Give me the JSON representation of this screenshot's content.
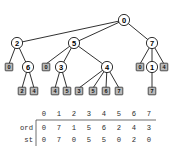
{
  "figure": {
    "kind": "tree-diagram-with-table",
    "tree": {
      "root": {
        "id": "n0",
        "label": "0",
        "type": "internal",
        "x": 124,
        "y": 20
      },
      "internal_nodes": [
        {
          "id": "n0",
          "label": "0",
          "x": 124,
          "y": 20
        },
        {
          "id": "n2",
          "label": "2",
          "x": 17,
          "y": 43
        },
        {
          "id": "n5",
          "label": "5",
          "x": 74,
          "y": 43
        },
        {
          "id": "n7",
          "label": "7",
          "x": 152,
          "y": 43
        },
        {
          "id": "n6",
          "label": "6",
          "x": 28,
          "y": 67
        },
        {
          "id": "n3",
          "label": "3",
          "x": 61,
          "y": 67
        },
        {
          "id": "n4",
          "label": "4",
          "x": 107,
          "y": 67
        },
        {
          "id": "n1",
          "label": "1",
          "x": 152,
          "y": 67
        }
      ],
      "leaves": [
        {
          "id": "l_a",
          "label": "0",
          "x": 9,
          "y": 67,
          "parent": "n2"
        },
        {
          "id": "l_b",
          "label": "2",
          "x": 22,
          "y": 91,
          "parent": "n6"
        },
        {
          "id": "l_c",
          "label": "4",
          "x": 34,
          "y": 91,
          "parent": "n6"
        },
        {
          "id": "l_d",
          "label": "0",
          "x": 46,
          "y": 67,
          "parent": "n5"
        },
        {
          "id": "l_e",
          "label": "4",
          "x": 55,
          "y": 91,
          "parent": "n3"
        },
        {
          "id": "l_f",
          "label": "5",
          "x": 67,
          "y": 91,
          "parent": "n3"
        },
        {
          "id": "l_g",
          "label": "3",
          "x": 79,
          "y": 91,
          "parent": "n4"
        },
        {
          "id": "l_h",
          "label": "5",
          "x": 93,
          "y": 91,
          "parent": "n4"
        },
        {
          "id": "l_i",
          "label": "6",
          "x": 106,
          "y": 91,
          "parent": "n4"
        },
        {
          "id": "l_j",
          "label": "7",
          "x": 119,
          "y": 91,
          "parent": "n4"
        },
        {
          "id": "l_k",
          "label": "0",
          "x": 140,
          "y": 67,
          "parent": "n7"
        },
        {
          "id": "l_l",
          "label": "4",
          "x": 164,
          "y": 67,
          "parent": "n7"
        },
        {
          "id": "l_m",
          "label": "7",
          "x": 152,
          "y": 91,
          "parent": "n1"
        }
      ],
      "edges": [
        {
          "from": "n0",
          "to": "n2"
        },
        {
          "from": "n0",
          "to": "n5"
        },
        {
          "from": "n0",
          "to": "n7"
        },
        {
          "from": "n2",
          "to": "l_a"
        },
        {
          "from": "n2",
          "to": "n6"
        },
        {
          "from": "n6",
          "to": "l_b"
        },
        {
          "from": "n6",
          "to": "l_c"
        },
        {
          "from": "n5",
          "to": "l_d"
        },
        {
          "from": "n5",
          "to": "n3"
        },
        {
          "from": "n5",
          "to": "n4"
        },
        {
          "from": "n3",
          "to": "l_e"
        },
        {
          "from": "n3",
          "to": "l_f"
        },
        {
          "from": "n4",
          "to": "l_g"
        },
        {
          "from": "n4",
          "to": "l_h"
        },
        {
          "from": "n4",
          "to": "l_i"
        },
        {
          "from": "n4",
          "to": "l_j"
        },
        {
          "from": "n7",
          "to": "l_k"
        },
        {
          "from": "n7",
          "to": "n1"
        },
        {
          "from": "n7",
          "to": "l_l"
        },
        {
          "from": "n1",
          "to": "l_m"
        }
      ]
    },
    "table": {
      "column_headers": [
        "0",
        "1",
        "2",
        "3",
        "4",
        "5",
        "6",
        "7"
      ],
      "rows": [
        {
          "label": "ord",
          "values": [
            "0",
            "7",
            "1",
            "5",
            "6",
            "2",
            "4",
            "3"
          ]
        },
        {
          "label": "st",
          "values": [
            "0",
            "7",
            "0",
            "5",
            "5",
            "0",
            "2",
            "0"
          ]
        }
      ]
    },
    "colors": {
      "stroke": "#1a1a1a",
      "leaf_fill": "#b9b9b9",
      "node_fill": "#ffffff",
      "table_text": "#2e2e2e",
      "background": "#ffffff"
    }
  }
}
